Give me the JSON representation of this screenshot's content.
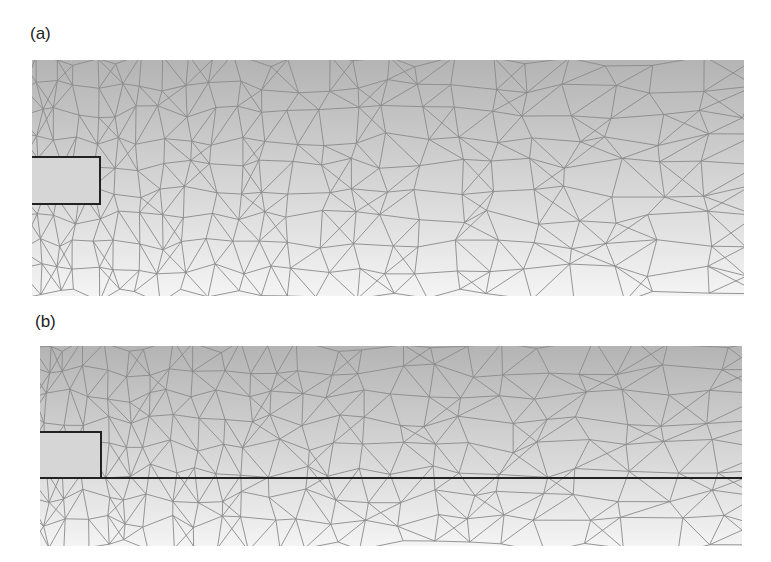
{
  "figure": {
    "panels": [
      {
        "label": "(a)",
        "description": "Triangular finite-element mesh around rectangular block at left edge"
      },
      {
        "label": "(b)",
        "description": "Triangular finite-element mesh with rectangular block and horizontal boundary line"
      }
    ],
    "colors": {
      "background_top": "#b4b4b4",
      "background_bottom": "#f4f4f4",
      "mesh_line": "#8a8a8a",
      "boundary_line": "#222222"
    }
  }
}
